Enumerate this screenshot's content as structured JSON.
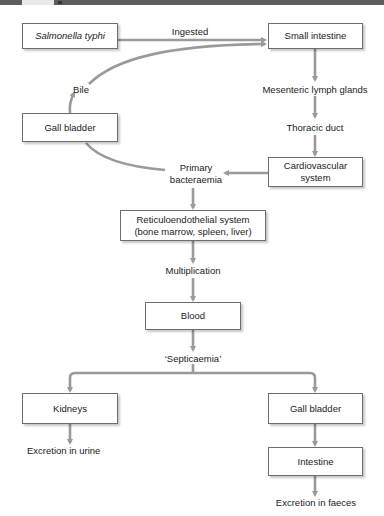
{
  "header": {
    "figure_number": "1"
  },
  "colors": {
    "arrow": "#9a9a9a",
    "box_border": "#6e6e6e",
    "header_bar": "#5d5d5d"
  },
  "nodes": {
    "salmonella": "Salmonella typhi",
    "small_intestine": "Small intestine",
    "gall_bladder_left": "Gall bladder",
    "cardiovascular_line1": "Cardiovascular",
    "cardiovascular_line2": "system",
    "reticulo_line1": "Reticuloendothelial system",
    "reticulo_line2": "(bone marrow, spleen, liver)",
    "blood": "Blood",
    "kidneys": "Kidneys",
    "gall_bladder_right": "Gall bladder",
    "intestine": "Intestine"
  },
  "labels": {
    "ingested": "Ingested",
    "bile": "Bile",
    "mesenteric": "Mesenteric lymph glands",
    "thoracic": "Thoracic duct",
    "primary_line1": "Primary",
    "primary_line2": "bacteraemia",
    "multiplication": "Multiplication",
    "septicaemia": "‘Septicaemia’",
    "excretion_urine": "Excretion in urine",
    "excretion_faeces": "Excretion in faeces"
  },
  "edges": [
    {
      "from": "salmonella",
      "to": "small_intestine",
      "label": "Ingested"
    },
    {
      "from": "gall_bladder_left",
      "to": "small_intestine",
      "label": "Bile"
    },
    {
      "from": "small_intestine",
      "to": "mesenteric"
    },
    {
      "from": "mesenteric",
      "to": "thoracic"
    },
    {
      "from": "thoracic",
      "to": "cardiovascular"
    },
    {
      "from": "cardiovascular",
      "to": "primary_bacteraemia"
    },
    {
      "from": "gall_bladder_left",
      "to": "primary_bacteraemia"
    },
    {
      "from": "primary_bacteraemia",
      "to": "reticulo"
    },
    {
      "from": "reticulo",
      "to": "multiplication"
    },
    {
      "from": "multiplication",
      "to": "blood"
    },
    {
      "from": "blood",
      "to": "septicaemia"
    },
    {
      "from": "septicaemia",
      "to": "kidneys"
    },
    {
      "from": "septicaemia",
      "to": "gall_bladder_right"
    },
    {
      "from": "kidneys",
      "to": "excretion_urine"
    },
    {
      "from": "gall_bladder_right",
      "to": "intestine"
    },
    {
      "from": "intestine",
      "to": "excretion_faeces"
    }
  ]
}
